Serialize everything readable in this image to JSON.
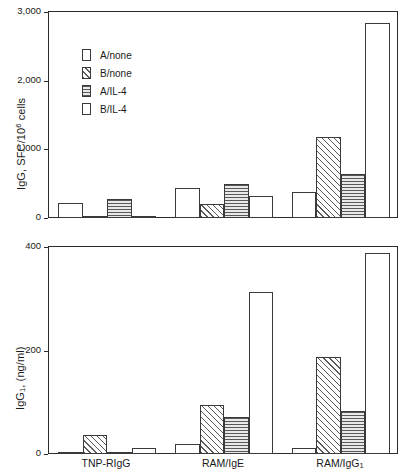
{
  "chart_data": [
    {
      "panel": "top",
      "type": "bar",
      "title": "",
      "xlabel": "",
      "ylabel": "IgG, SFC/10⁶ cells",
      "ylabel_main": "IgG, SFC/10",
      "ylabel_exp": "6",
      "ylabel_tail": " cells",
      "ylim": [
        0,
        3000
      ],
      "yticks": [
        0,
        1000,
        2000,
        3000
      ],
      "ytick_labels": [
        "0",
        "1,000",
        "2,000",
        "3,000"
      ],
      "grid": false,
      "legend_position": "upper-left",
      "categories": [
        "TNP-RIgG",
        "RAM/IgE",
        "RAM/IgG₁"
      ],
      "series": [
        {
          "name": "A/none",
          "pattern": "none",
          "values": [
            220,
            440,
            370
          ]
        },
        {
          "name": "B/none",
          "pattern": "diag",
          "values": [
            30,
            200,
            1180
          ]
        },
        {
          "name": "A/IL-4",
          "pattern": "horiz",
          "values": [
            280,
            500,
            640
          ]
        },
        {
          "name": "B/IL-4",
          "pattern": "check",
          "values": [
            20,
            320,
            2830
          ]
        }
      ]
    },
    {
      "panel": "bottom",
      "type": "bar",
      "title": "",
      "xlabel": "",
      "ylabel": "IgG₁, (ng/ml)",
      "ylabel_main": "IgG",
      "ylabel_sub": "1",
      "ylabel_tail": ", (ng/ml)",
      "ylim": [
        0,
        440
      ],
      "yticks": [
        0,
        200,
        400
      ],
      "ytick_labels": [
        "0",
        "200",
        "400"
      ],
      "grid": false,
      "legend_position": "none",
      "categories": [
        "TNP-RIgG",
        "RAM/IgE",
        "RAM/IgG₁"
      ],
      "series": [
        {
          "name": "A/none",
          "pattern": "none",
          "values": [
            4,
            22,
            13
          ]
        },
        {
          "name": "B/none",
          "pattern": "diag",
          "values": [
            40,
            103,
            205
          ]
        },
        {
          "name": "A/IL-4",
          "pattern": "horiz",
          "values": [
            3,
            78,
            92
          ]
        },
        {
          "name": "B/IL-4",
          "pattern": "check",
          "values": [
            13,
            342,
            425
          ]
        }
      ]
    }
  ],
  "legend": {
    "items": [
      {
        "label": "A/none",
        "pattern": "none"
      },
      {
        "label": "B/none",
        "pattern": "diag"
      },
      {
        "label": "A/IL-4",
        "pattern": "horiz"
      },
      {
        "label": "B/IL-4",
        "pattern": "check"
      }
    ]
  },
  "categories": [
    "TNP-RIgG",
    "RAM/IgE",
    "RAM/IgG₁"
  ],
  "category_labels": [
    {
      "main": "TNP-RIgG",
      "sub": ""
    },
    {
      "main": "RAM/IgE",
      "sub": ""
    },
    {
      "main": "RAM/IgG",
      "sub": "1"
    }
  ],
  "colors": {
    "axis": "#2b2b2b",
    "bar_outline": "#3a3a3a",
    "text": "#1a1a1a",
    "background": "#ffffff"
  }
}
